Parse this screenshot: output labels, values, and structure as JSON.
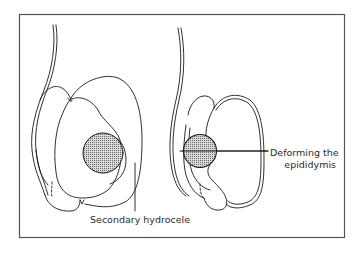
{
  "figure": {
    "type": "medical-line-illustration",
    "frame_color": "#555555",
    "stroke_color": "#1a1a1a",
    "mass_fill": "#bdbdbd",
    "panels": [
      {
        "id": "left",
        "description": "Testis with intratesticular mass and secondary hydrocele",
        "label": "Secondary hydrocele"
      },
      {
        "id": "right",
        "description": "Testis with mass deforming the epididymis",
        "label_line1": "Deforming the",
        "label_line2": "epididymis"
      }
    ]
  }
}
